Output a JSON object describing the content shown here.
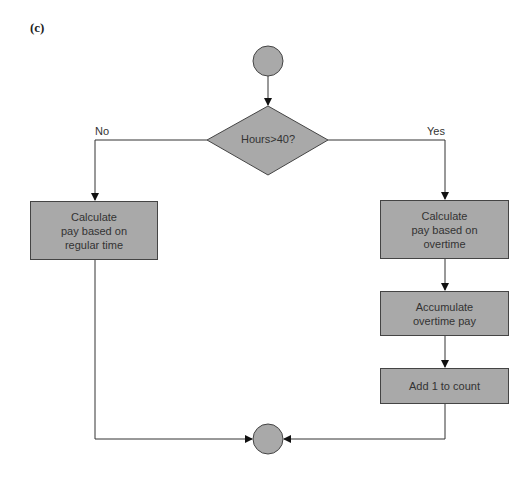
{
  "figure_label": "(c)",
  "decision": {
    "text": "Hours>40?"
  },
  "branches": {
    "no": "No",
    "yes": "Yes"
  },
  "boxes": [
    {
      "id": "regular",
      "text": "Calculate\npay based on\nregular time"
    },
    {
      "id": "overtime",
      "text": "Calculate\npay based on\novertime"
    },
    {
      "id": "accumulate",
      "text": "Accumulate\novertime pay"
    },
    {
      "id": "count",
      "text": "Add 1 to count"
    }
  ],
  "colors": {
    "fill": "#a9a9a9",
    "stroke": "#444444"
  }
}
